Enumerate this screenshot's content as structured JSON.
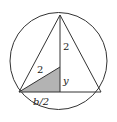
{
  "diagram": {
    "colors": {
      "stroke": "#333333",
      "shade": "#b3b3b3",
      "background": "#ffffff"
    },
    "labels": {
      "radius_upper": "2",
      "radius_slant": "2",
      "segment_y": "y",
      "half_base": "b/2"
    }
  }
}
